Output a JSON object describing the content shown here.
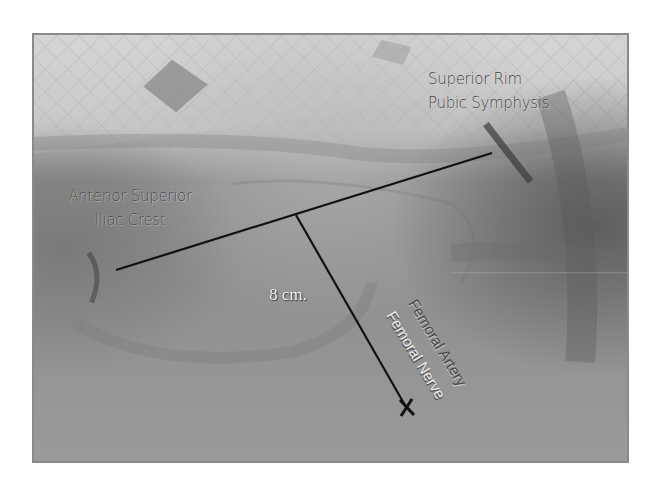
{
  "figure": {
    "colors": {
      "background": "#ffffff",
      "photo_border": "#8a8a8a",
      "annotation_line": "#111111",
      "dark_label": "#3c3c3c",
      "light_label": "#f0f0f0"
    }
  },
  "labels": {
    "asis_line1": "Anterior Superior",
    "asis_line2": "Iliac Crest",
    "pubic_line1": "Superior Rim",
    "pubic_line2": "Pubic Symphysis",
    "measurement": "8 cm.",
    "artery": "Femoral Artery",
    "nerve": "Femoral Nerve"
  },
  "annotations": {
    "inguinal_line": {
      "x1": 116,
      "y1": 270,
      "x2": 492,
      "y2": 153
    },
    "perpendicular_line": {
      "x1": 296,
      "y1": 215,
      "x2": 406,
      "y2": 407
    },
    "target_marker": {
      "x": 407,
      "y": 408,
      "symbol": "X"
    }
  }
}
